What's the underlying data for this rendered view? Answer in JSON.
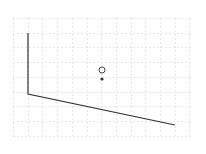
{
  "canvas": {
    "width": 206,
    "height": 154,
    "background": "#ffffff"
  },
  "grid": {
    "x0": 13,
    "y0": 18,
    "x1": 191,
    "y1": 138,
    "spacing": 14.7,
    "color": "#e6e6e6",
    "dash": "2,2"
  },
  "shapes": {
    "polyline": {
      "points": "28,33 28,94 175,125",
      "stroke": "#333333",
      "stroke_width": 1.2
    },
    "hollow_circle": {
      "cx": 102,
      "cy": 70,
      "r": 3,
      "stroke": "#444444",
      "fill": "#ffffff"
    },
    "filled_dot": {
      "cx": 102,
      "cy": 79,
      "r": 1.6,
      "fill": "#333333"
    }
  }
}
